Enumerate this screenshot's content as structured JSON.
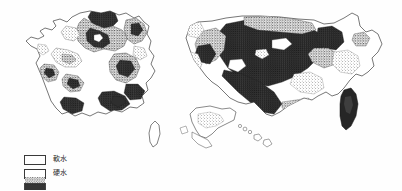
{
  "figure": {
    "kind": "scanned-figure",
    "background_color": "#fefefe",
    "ink_color": "#2b2b2b",
    "outline_color": "#4a4a4a"
  },
  "maps": [
    {
      "id": "france",
      "name": "map-france",
      "title": "",
      "regions_shaded": "hard-water stippled zones across north, northeast, east and southeast; soft-water white zones in Brittany, Massif Central, Landes and Corsica",
      "islands": [
        "Corsica"
      ]
    },
    {
      "id": "usa",
      "name": "map-usa",
      "title": "",
      "regions_shaded": "hard-water stippled zones across Midwest, Great Plains, Southwest and Florida; soft-water white zones in Pacific Northwest, Northeast and Southeast coastal plain",
      "islands": [
        "Alaska",
        "Hawaii"
      ]
    }
  ],
  "legend": {
    "name": "map-legend",
    "items": [
      {
        "label": "軟水",
        "pattern": "white",
        "swatch_class": "soft"
      },
      {
        "label": "硬水",
        "pattern": "stipple",
        "swatch_class": "hard"
      },
      {
        "label": "",
        "pattern": "solid-dark",
        "swatch_class": "veryhard"
      }
    ]
  }
}
